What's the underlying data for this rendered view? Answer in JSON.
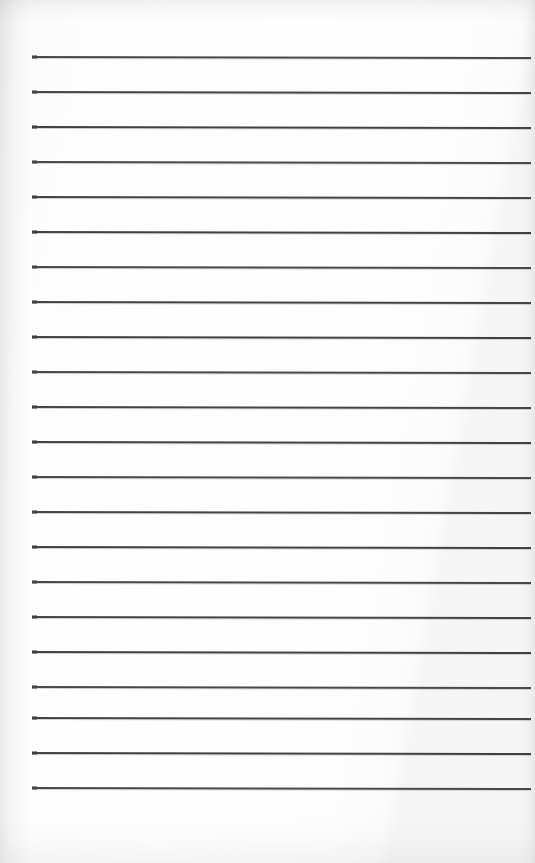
{
  "document": {
    "type": "scanned-lined-notebook-page",
    "title": "Blank ruled notebook page",
    "orientation": "portrait",
    "width_px": 535,
    "height_px": 863,
    "handwriting_present": false,
    "text_content": "",
    "margins": {
      "left_px": 32,
      "right_px": 531,
      "top_first_line_px": 56,
      "bottom_last_line_px": 787
    },
    "colors": {
      "paper": "#fdfdfd",
      "paper_edge_tint": "#f4f4f5",
      "rule_ink": "#3b3c40",
      "rule_bleed": "#46484e"
    },
    "ruling": {
      "style": "wide-ruled horizontal lines",
      "line_count": 22,
      "line_spacing_px": 35,
      "line_thickness_px": 2,
      "line_start_x_px": 32,
      "line_end_x_px": 531,
      "skew_px_across_page": 1,
      "line_y_positions": [
        56,
        91,
        126,
        161,
        196,
        231,
        266,
        301,
        336,
        371,
        406,
        441,
        476,
        511,
        546,
        581,
        616,
        651,
        686,
        717,
        752,
        787
      ]
    },
    "scan_artifacts": {
      "top_edge_band": true,
      "left_edge_shadow": true,
      "right_edge_shadow": true,
      "bottom_edge_shadow": true,
      "paper_grain": true
    }
  }
}
